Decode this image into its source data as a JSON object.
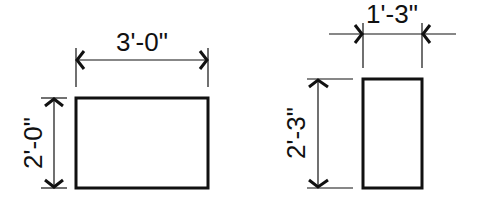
{
  "diagram": {
    "type": "dimensioned-rectangles",
    "line_color": "#111111",
    "background": "#ffffff",
    "shapes": [
      {
        "name": "left-rectangle",
        "width_label": "3'-0\"",
        "height_label": "2'-0\""
      },
      {
        "name": "right-rectangle",
        "width_label": "1'-3\"",
        "height_label": "2'-3\""
      }
    ]
  }
}
